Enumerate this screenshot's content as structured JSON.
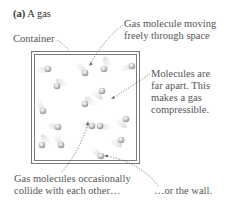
{
  "figure": {
    "label": "(a)",
    "title": "A gas"
  },
  "labels": {
    "container": "Container",
    "moving_line1": "Gas molecule moving",
    "moving_line2": "freely through space",
    "apart_line1": "Molecules are",
    "apart_line2": "far apart. This",
    "apart_line3": "makes a gas",
    "apart_line4": "compressible.",
    "collide_line1": "Gas molecules occasionally",
    "collide_line2": "collide with each other…",
    "wall": "…or the wall."
  },
  "colors": {
    "text": "#555555",
    "container_border": "#7a7a7a",
    "molecule": "#bdbdbd",
    "leader": "#6a6a6a"
  },
  "molecules": [
    {
      "x": 48,
      "y": 69
    },
    {
      "x": 85,
      "y": 73
    },
    {
      "x": 104,
      "y": 69
    },
    {
      "x": 132,
      "y": 66
    },
    {
      "x": 57,
      "y": 86
    },
    {
      "x": 102,
      "y": 91
    },
    {
      "x": 43,
      "y": 111
    },
    {
      "x": 85,
      "y": 104
    },
    {
      "x": 92,
      "y": 126
    },
    {
      "x": 100,
      "y": 126
    },
    {
      "x": 58,
      "y": 127
    },
    {
      "x": 126,
      "y": 119
    },
    {
      "x": 42,
      "y": 145
    },
    {
      "x": 61,
      "y": 145
    },
    {
      "x": 121,
      "y": 140
    },
    {
      "x": 101,
      "y": 156
    }
  ]
}
